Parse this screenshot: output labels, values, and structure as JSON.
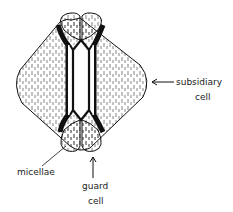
{
  "diagram": {
    "labels": {
      "subsidiary_1": "subsidiary",
      "subsidiary_2": "cell",
      "micellae": "micellae",
      "guard_1": "guard",
      "guard_2": "cell"
    },
    "colors": {
      "ink": "#111111",
      "background": "#ffffff"
    }
  }
}
